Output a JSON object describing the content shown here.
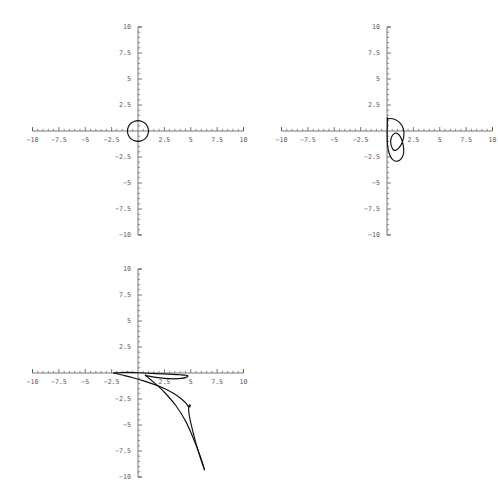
{
  "figure": {
    "background_color": "#ffffff",
    "axis_color": "#555555",
    "curve_color": "#111111",
    "label_color": "#5b5b5b",
    "panel_count": 3,
    "layout": "2x2 grid, fourth cell empty"
  },
  "axes_common": {
    "xlim": [
      -10,
      10
    ],
    "ylim": [
      -10,
      10
    ],
    "x_tick_labels": [
      "-10",
      "-7.5",
      "-5",
      "-2.5",
      "2.5",
      "5",
      "7.5",
      "10"
    ],
    "x_tick_values": [
      -10,
      -7.5,
      -5,
      -2.5,
      2.5,
      5,
      7.5,
      10
    ],
    "y_tick_labels": [
      "10",
      "7.5",
      "5",
      "2.5",
      "-2.5",
      "-5",
      "-7.5",
      "-10"
    ],
    "y_tick_values": [
      10,
      7.5,
      5,
      2.5,
      -2.5,
      -5,
      -7.5,
      -10
    ],
    "major_tick_step": 2.5,
    "minor_ticks_between_majors": 4,
    "grid": false,
    "legend": null,
    "origin_labeled": false,
    "style": "mathematica-style centered cross axes"
  },
  "chart_data": [
    {
      "type": "line",
      "title": "",
      "xlabel": "",
      "ylabel": "",
      "xlim": [
        -10,
        10
      ],
      "ylim": [
        -10,
        10
      ],
      "grid": false,
      "legend": null,
      "annotations": [
        "closed circular loop of radius ~1 centered at origin"
      ],
      "series": [
        {
          "name": "curve-1",
          "closed": true,
          "x": [
            1.0,
            0.92,
            0.71,
            0.38,
            0.0,
            -0.38,
            -0.71,
            -0.92,
            -1.0,
            -0.92,
            -0.71,
            -0.38,
            0.0,
            0.38,
            0.71,
            0.92,
            1.0
          ],
          "y": [
            0.0,
            0.38,
            0.71,
            0.92,
            1.0,
            0.92,
            0.71,
            0.38,
            0.0,
            -0.38,
            -0.71,
            -0.92,
            -1.0,
            -0.92,
            -0.71,
            -0.38,
            0.0
          ]
        }
      ]
    },
    {
      "type": "line",
      "title": "",
      "xlabel": "",
      "ylabel": "",
      "xlim": [
        -10,
        10
      ],
      "ylim": [
        -10,
        10
      ],
      "grid": false,
      "legend": null,
      "annotations": [
        "folded self-intersecting loop near origin spanning x 0 to 1.6, y -2.9 to 1.2"
      ],
      "series": [
        {
          "name": "curve-2",
          "closed": true,
          "x": [
            0.05,
            0.3,
            0.75,
            1.15,
            1.45,
            1.6,
            1.58,
            1.42,
            1.15,
            0.85,
            0.6,
            0.42,
            0.35,
            0.42,
            0.62,
            0.9,
            1.2,
            1.45,
            1.58,
            1.55,
            1.35,
            1.0,
            0.6,
            0.28,
            0.08,
            0.02,
            0.05
          ],
          "y": [
            1.15,
            1.2,
            1.1,
            0.85,
            0.45,
            -0.05,
            -0.6,
            -1.15,
            -1.6,
            -1.85,
            -1.8,
            -1.45,
            -1.0,
            -0.6,
            -0.3,
            -0.2,
            -0.45,
            -1.0,
            -1.7,
            -2.25,
            -2.65,
            -2.9,
            -2.8,
            -2.35,
            -1.6,
            -0.4,
            1.15
          ]
        }
      ]
    },
    {
      "type": "line",
      "title": "",
      "xlabel": "",
      "ylabel": "",
      "xlim": [
        -10,
        10
      ],
      "ylim": [
        -10,
        10
      ],
      "grid": false,
      "legend": null,
      "annotations": [
        "narrow cusped loop from (-2.3, 0) sweeping right then steeply down to about (6.3, -9.3)"
      ],
      "series": [
        {
          "name": "curve-3-upper",
          "closed": false,
          "x": [
            -2.3,
            -1.6,
            -0.8,
            0.2,
            1.3,
            2.4,
            3.3,
            4.0,
            4.55,
            4.75,
            4.55,
            4.1,
            3.4,
            2.55,
            1.7,
            1.05,
            0.7,
            0.85,
            1.5,
            2.5,
            3.6,
            4.55,
            5.25,
            5.75,
            6.1,
            6.3
          ],
          "y": [
            0.0,
            0.05,
            0.06,
            0.02,
            -0.04,
            -0.09,
            -0.13,
            -0.17,
            -0.22,
            -0.3,
            -0.42,
            -0.52,
            -0.56,
            -0.52,
            -0.42,
            -0.3,
            -0.2,
            -0.35,
            -0.9,
            -1.85,
            -3.15,
            -4.7,
            -6.3,
            -7.6,
            -8.6,
            -9.3
          ]
        },
        {
          "name": "curve-3-lower",
          "closed": false,
          "x": [
            -2.3,
            -1.4,
            -0.4,
            0.6,
            1.6,
            2.55,
            3.35,
            4.0,
            4.5,
            4.8,
            4.95,
            4.9,
            4.8,
            4.85,
            5.1,
            5.45,
            5.8,
            6.05,
            6.25,
            6.3
          ],
          "y": [
            0.0,
            -0.22,
            -0.48,
            -0.78,
            -1.12,
            -1.52,
            -1.95,
            -2.4,
            -2.85,
            -3.25,
            -3.2,
            -3.05,
            -3.3,
            -4.0,
            -5.2,
            -6.6,
            -7.8,
            -8.6,
            -9.15,
            -9.3
          ]
        }
      ]
    }
  ]
}
